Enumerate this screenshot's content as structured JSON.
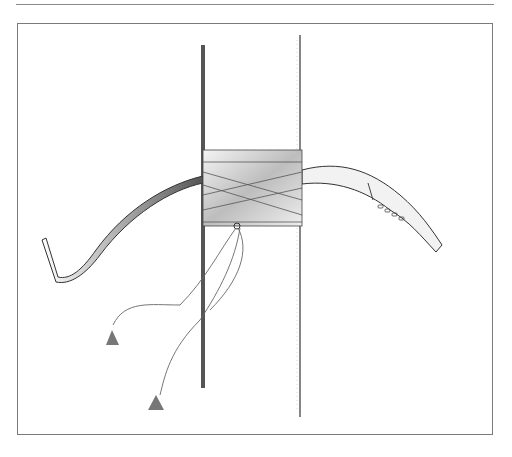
{
  "illustration": {
    "subject": "bow strapped to a pole with ribbon wrapping and tasseled ties",
    "style": "pencil drawing",
    "colors": {
      "background": "#ffffff",
      "line": "#3a3a3a",
      "shade": "#6e6e6e",
      "frame": "#7a7a7a"
    },
    "bow_grip_marks": 4
  }
}
